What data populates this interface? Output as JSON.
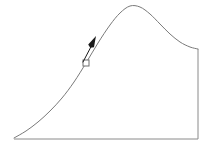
{
  "figure": {
    "title": "Skewed unimodal curve with marker annotation",
    "width": 210,
    "height": 148,
    "background_color": "#ffffff"
  },
  "style": {
    "curve_color": "#7a7a7a",
    "axis_color": "#8a8a8a",
    "marker_outline_color": "#6f6f6f",
    "pointer_color": "#1a1a1a",
    "curve_stroke_width": 1,
    "axis_stroke_width": 1
  },
  "chart_data": {
    "type": "line",
    "title": "",
    "subtitle": "",
    "xlabel": "",
    "ylabel": "",
    "grid": false,
    "legend": false,
    "legend_position": "none",
    "xlim": [
      0,
      210
    ],
    "ylim": [
      0,
      148
    ],
    "axis_ticks": {
      "x": [],
      "y": []
    },
    "series": [
      {
        "name": "distribution-curve",
        "kind": "smooth-line",
        "description": "Right-skewed unimodal curve rising from lower-left baseline vertex to a rounded peak then descending and flattening into the right vertical edge",
        "points": [
          [
            14,
            138
          ],
          [
            26,
            131
          ],
          [
            38,
            122
          ],
          [
            50,
            111
          ],
          [
            62,
            98
          ],
          [
            74,
            82
          ],
          [
            86,
            63
          ],
          [
            98,
            43
          ],
          [
            110,
            25
          ],
          [
            120,
            13
          ],
          [
            130,
            6
          ],
          [
            140,
            7
          ],
          [
            150,
            14
          ],
          [
            160,
            24
          ],
          [
            170,
            34
          ],
          [
            180,
            42
          ],
          [
            190,
            47
          ],
          [
            198,
            49
          ]
        ]
      },
      {
        "name": "baseline-axis",
        "kind": "straight-line",
        "description": "Horizontal baseline from the curve origin vertex to the lower-right corner",
        "points": [
          [
            14,
            139
          ],
          [
            198,
            139
          ]
        ]
      },
      {
        "name": "right-edge-axis",
        "kind": "straight-line",
        "description": "Vertical right boundary connecting curve endpoint down to the baseline",
        "points": [
          [
            198,
            49
          ],
          [
            198,
            139
          ]
        ]
      }
    ],
    "annotations": [
      {
        "name": "point-marker",
        "kind": "open-square",
        "x": 86,
        "y": 63,
        "size": 6,
        "label": ""
      },
      {
        "name": "pointer-arrow",
        "kind": "arrow-cursor",
        "tip_x": 96,
        "tip_y": 36,
        "tail_x": 83,
        "tail_y": 62,
        "label": ""
      }
    ]
  }
}
